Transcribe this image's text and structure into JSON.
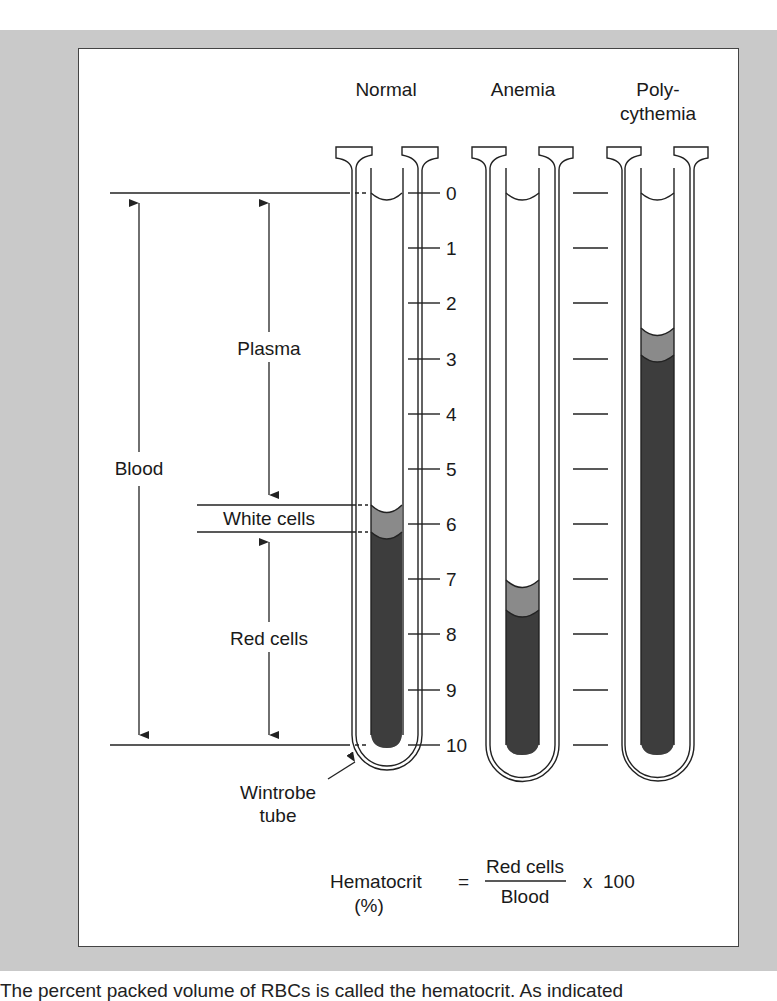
{
  "figure": {
    "columns": [
      {
        "id": "normal",
        "label": "Normal"
      },
      {
        "id": "anemia",
        "label": "Anemia"
      },
      {
        "id": "polycythemia",
        "label_line1": "Poly-",
        "label_line2": "cythemia"
      }
    ],
    "scale": {
      "ticks": [
        "0",
        "1",
        "2",
        "3",
        "4",
        "5",
        "6",
        "7",
        "8",
        "9",
        "10"
      ]
    },
    "annotations": {
      "blood": "Blood",
      "plasma": "Plasma",
      "white_cells": "White cells",
      "red_cells": "Red cells",
      "tube_line1": "Wintrobe",
      "tube_line2": "tube"
    },
    "formula": {
      "lhs": "Hematocrit",
      "lhs_unit": "(%)",
      "equals": "=",
      "numerator": "Red cells",
      "denominator": "Blood",
      "multiplier": "x  100"
    },
    "tubes": [
      {
        "name": "Normal",
        "white_cells_top": 5.7,
        "red_cells_top": 6.1,
        "bottom": 10
      },
      {
        "name": "Anemia",
        "white_cells_top": 7.0,
        "red_cells_top": 7.4,
        "bottom": 10
      },
      {
        "name": "Polycythemia",
        "white_cells_top": 2.5,
        "red_cells_top": 2.9,
        "bottom": 10
      }
    ],
    "colors": {
      "frame": "#c9c9c9",
      "red_cells": "#3d3d3d",
      "white_cells": "#8a8a8a",
      "line": "#222222"
    }
  },
  "caption": "The percent packed volume of RBCs is called the hematocrit. As indicated"
}
